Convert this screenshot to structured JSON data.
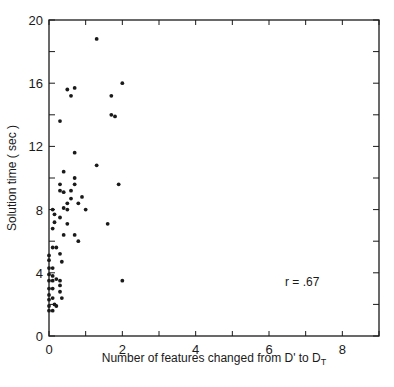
{
  "chart_data": {
    "type": "scatter",
    "title": "",
    "xlabel": "Number of features changed from D' to D_T",
    "xlabel_parts": {
      "main": "Number of features changed from D' to D",
      "subscript": "T"
    },
    "ylabel": "Solution time ( sec )",
    "xlim": [
      0,
      9
    ],
    "ylim": [
      0,
      20
    ],
    "xticks": [
      0,
      2,
      4,
      6,
      8
    ],
    "yticks": [
      0,
      4,
      8,
      12,
      16,
      20
    ],
    "grid": false,
    "annotation": "r = .67",
    "points": [
      {
        "x": 1.3,
        "y": 18.8
      },
      {
        "x": 2.0,
        "y": 16.0
      },
      {
        "x": 1.7,
        "y": 15.2
      },
      {
        "x": 1.7,
        "y": 14.0
      },
      {
        "x": 1.8,
        "y": 13.9
      },
      {
        "x": 0.5,
        "y": 15.6
      },
      {
        "x": 0.7,
        "y": 15.7
      },
      {
        "x": 0.6,
        "y": 15.2
      },
      {
        "x": 0.3,
        "y": 13.6
      },
      {
        "x": 0.7,
        "y": 11.6
      },
      {
        "x": 1.3,
        "y": 10.8
      },
      {
        "x": 0.4,
        "y": 10.4
      },
      {
        "x": 0.7,
        "y": 10.0
      },
      {
        "x": 0.3,
        "y": 9.6
      },
      {
        "x": 0.7,
        "y": 9.6
      },
      {
        "x": 1.9,
        "y": 9.6
      },
      {
        "x": 0.3,
        "y": 9.2
      },
      {
        "x": 0.4,
        "y": 9.1
      },
      {
        "x": 0.6,
        "y": 9.2
      },
      {
        "x": 0.6,
        "y": 8.7
      },
      {
        "x": 0.9,
        "y": 8.8
      },
      {
        "x": 0.5,
        "y": 8.4
      },
      {
        "x": 0.8,
        "y": 8.4
      },
      {
        "x": 0.4,
        "y": 8.1
      },
      {
        "x": 0.5,
        "y": 8.0
      },
      {
        "x": 1.0,
        "y": 8.0
      },
      {
        "x": 0.1,
        "y": 8.0
      },
      {
        "x": 0.15,
        "y": 7.7
      },
      {
        "x": 0.3,
        "y": 7.5
      },
      {
        "x": 0.15,
        "y": 7.2
      },
      {
        "x": 0.5,
        "y": 7.1
      },
      {
        "x": 1.6,
        "y": 7.1
      },
      {
        "x": 0.1,
        "y": 6.8
      },
      {
        "x": 0.4,
        "y": 6.4
      },
      {
        "x": 0.7,
        "y": 6.4
      },
      {
        "x": 0.8,
        "y": 6.0
      },
      {
        "x": 0.1,
        "y": 5.6
      },
      {
        "x": 0.2,
        "y": 5.6
      },
      {
        "x": 0.0,
        "y": 5.1
      },
      {
        "x": 0.3,
        "y": 5.2
      },
      {
        "x": 0.0,
        "y": 4.8
      },
      {
        "x": 0.35,
        "y": 4.7
      },
      {
        "x": 0.0,
        "y": 4.3
      },
      {
        "x": 0.1,
        "y": 4.3
      },
      {
        "x": 0.0,
        "y": 3.9
      },
      {
        "x": 0.1,
        "y": 3.8
      },
      {
        "x": 0.0,
        "y": 3.5
      },
      {
        "x": 0.1,
        "y": 3.5
      },
      {
        "x": 0.2,
        "y": 3.6
      },
      {
        "x": 0.3,
        "y": 3.5
      },
      {
        "x": 2.0,
        "y": 3.5
      },
      {
        "x": 0.3,
        "y": 3.2
      },
      {
        "x": 0.0,
        "y": 3.0
      },
      {
        "x": 0.1,
        "y": 3.0
      },
      {
        "x": 0.3,
        "y": 2.8
      },
      {
        "x": 0.0,
        "y": 2.6
      },
      {
        "x": 0.0,
        "y": 2.3
      },
      {
        "x": 0.1,
        "y": 2.4
      },
      {
        "x": 0.35,
        "y": 2.4
      },
      {
        "x": 0.0,
        "y": 1.9
      },
      {
        "x": 0.15,
        "y": 2.0
      },
      {
        "x": 0.2,
        "y": 1.9
      },
      {
        "x": 0.0,
        "y": 1.6
      },
      {
        "x": 0.1,
        "y": 1.6
      }
    ]
  }
}
